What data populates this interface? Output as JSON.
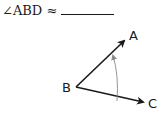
{
  "question": {
    "prompt": "∠ABD ≈",
    "answer_blank": ""
  },
  "figure": {
    "labels": {
      "vertex": "B",
      "ray1": "A",
      "ray2": "C"
    },
    "colors": {
      "ray": "#1a1a1a",
      "arc": "#8a8a8a"
    }
  }
}
